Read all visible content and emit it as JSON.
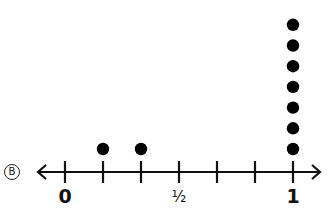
{
  "option_letter": "B",
  "chart_data": {
    "type": "dot_plot",
    "title": "",
    "xlabel": "",
    "ylabel": "",
    "xlim": [
      0,
      1
    ],
    "ticks": [
      0,
      0.1667,
      0.3333,
      0.5,
      0.6667,
      0.8333,
      1
    ],
    "tick_labels": [
      {
        "value": 0,
        "label": "0"
      },
      {
        "value": 0.5,
        "label": "½"
      },
      {
        "value": 1,
        "label": "1"
      }
    ],
    "points": [
      {
        "x": "1/6",
        "count": 1
      },
      {
        "x": "1/3",
        "count": 1
      },
      {
        "x": "1",
        "count": 7
      }
    ],
    "grid": false,
    "legend": null
  }
}
